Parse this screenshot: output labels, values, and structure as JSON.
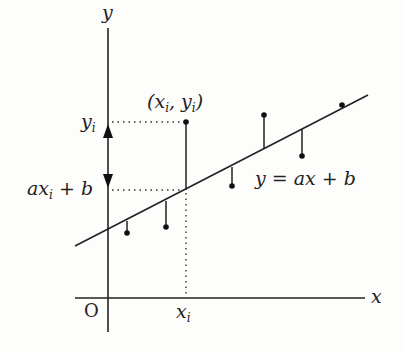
{
  "diagram": {
    "labels": {
      "y_axis": "y",
      "x_axis": "x",
      "origin": "O",
      "yi": "y",
      "yi_sub": "i",
      "axib_a": "ax",
      "axib_sub": "i",
      "axib_rest": " + b",
      "point_open": "(x",
      "point_sub1": "i",
      "point_mid": ", y",
      "point_sub2": "i",
      "point_close": ")",
      "line_eq": "y = ax + b",
      "xi": "x",
      "xi_sub": "i"
    },
    "line": {
      "slope": 0.51,
      "intercept": 0.52
    },
    "points": [
      {
        "x": 0.19,
        "residual": "below"
      },
      {
        "x": 0.58,
        "residual": "below"
      },
      {
        "x": 0.78,
        "residual": "above",
        "highlighted": true
      },
      {
        "x": 1.24,
        "residual": "below"
      },
      {
        "x": 1.56,
        "residual": "above"
      },
      {
        "x": 1.94,
        "residual": "below"
      },
      {
        "x": 2.34,
        "residual": "on-line"
      }
    ],
    "colors": {
      "ink": "#222222",
      "background": "#fdfdfb"
    }
  }
}
